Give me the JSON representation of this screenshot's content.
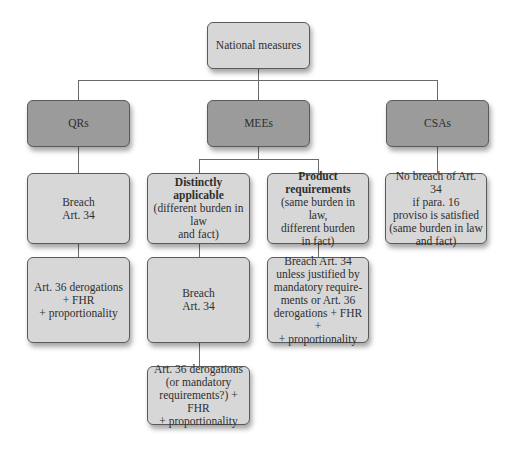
{
  "diagram": {
    "root": {
      "label": "National measures"
    },
    "categories": [
      {
        "id": "qrs",
        "label": "QRs"
      },
      {
        "id": "mees",
        "label": "MEEs"
      },
      {
        "id": "csas",
        "label": "CSAs"
      }
    ],
    "qrs_branch": {
      "level1": {
        "lines": [
          "Breach",
          "Art. 34"
        ]
      },
      "level2": {
        "lines": [
          "Art. 36 derogations",
          "+ FHR",
          "+ proportionality"
        ]
      }
    },
    "mees_branch": {
      "distinctly_applicable": {
        "title_lines": [
          "Distinctly",
          "applicable"
        ],
        "desc_lines": [
          "(different burden in law",
          "and fact)"
        ],
        "level2": {
          "lines": [
            "Breach",
            "Art. 34"
          ]
        },
        "level3": {
          "lines": [
            "Art. 36 derogations",
            "(or mandatory",
            "requirements?) + FHR",
            "+ proportionality"
          ]
        }
      },
      "product_requirements": {
        "title_lines": [
          "Product",
          "requirements"
        ],
        "desc_lines": [
          "(same burden in law,",
          "different burden",
          "in fact)"
        ],
        "level2": {
          "lines": [
            "Breach Art. 34",
            "unless justified by",
            "mandatory require-",
            "ments or Art. 36",
            "derogations + FHR +",
            "+ proportionality"
          ]
        }
      }
    },
    "csas_branch": {
      "level1": {
        "lines": [
          "No breach of Art. 34",
          "if para. 16",
          "proviso is satisfied",
          "(same burden in law",
          "and fact)"
        ]
      }
    },
    "colors": {
      "light_box": "#d7d7d7",
      "dark_box": "#9b9b9b",
      "border": "#5a5a5a",
      "connector": "#6a6a6a",
      "background": "#ffffff"
    }
  }
}
